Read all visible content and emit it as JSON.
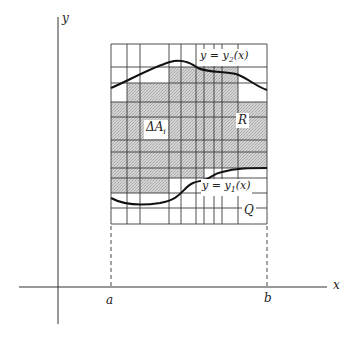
{
  "figure": {
    "colors": {
      "background": "#ffffff",
      "ink": "#222222",
      "grid_line": "#444444",
      "shade": "#c8c8c8"
    }
  },
  "axes": {
    "x_label": "x",
    "y_label": "y",
    "a_label": "a",
    "b_label": "b"
  },
  "labels": {
    "upper_curve": "y = y",
    "upper_curve_sub": "2",
    "upper_curve_tail": "(x)",
    "lower_curve": "y = y",
    "lower_curve_sub": "1",
    "lower_curve_tail": "(x)",
    "delta_a": "ΔA",
    "delta_a_sub": "i",
    "region_r": "R",
    "rectangle_q": "Q"
  },
  "grid": {
    "x_lines": [
      111,
      127,
      140,
      169,
      181,
      196,
      204,
      214,
      222,
      238,
      267
    ],
    "y_lines": [
      44,
      67,
      83,
      102,
      117,
      140,
      152,
      168,
      178,
      193,
      208,
      224
    ]
  }
}
